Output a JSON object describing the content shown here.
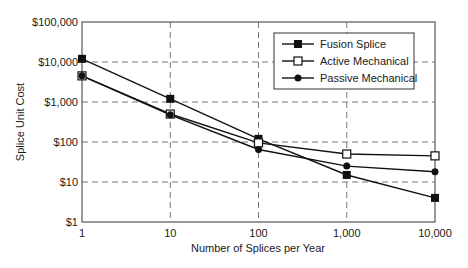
{
  "chart_data": {
    "type": "line",
    "title": "",
    "xlabel": "Number of Splices per Year",
    "ylabel": "Splice Unit Cost",
    "x_scale": "log",
    "y_scale": "log",
    "x": [
      1,
      10,
      100,
      1000,
      10000
    ],
    "x_tick_labels": [
      "1",
      "10",
      "100",
      "1,000",
      "10,000"
    ],
    "y_ticks": [
      1,
      10,
      100,
      1000,
      10000,
      100000
    ],
    "y_tick_labels": [
      "$1",
      "$10",
      "$100",
      "$1,000",
      "$10,000",
      "$100,000"
    ],
    "xlim": [
      1,
      10000
    ],
    "ylim": [
      1,
      100000
    ],
    "grid": true,
    "legend_position": "upper right",
    "series": [
      {
        "name": "Fusion Splice",
        "marker": "filled-square",
        "values": [
          12000,
          1200,
          120,
          15,
          4
        ]
      },
      {
        "name": "Active Mechanical",
        "marker": "open-square",
        "values": [
          4500,
          500,
          95,
          50,
          45
        ]
      },
      {
        "name": "Passive Mechanical",
        "marker": "filled-circle",
        "values": [
          4500,
          480,
          65,
          25,
          18
        ]
      }
    ]
  }
}
